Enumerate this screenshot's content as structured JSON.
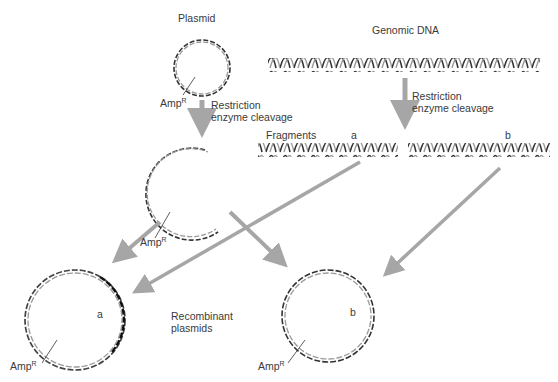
{
  "labels": {
    "plasmid": "Plasmid",
    "genomic_dna": "Genomic DNA",
    "restriction_1": "Restriction",
    "restriction_2": "enzyme cleavage",
    "fragments": "Fragments",
    "frag_a": "a",
    "frag_b": "b",
    "amp": "Amp",
    "amp_sup": "R",
    "recombinant_1": "Recombinant",
    "recombinant_2": "plasmids"
  },
  "colors": {
    "arrow": "#a6a6a6",
    "strand_dark": "#3a3a3a",
    "strand_light": "#8a8a8a",
    "text": "#3a3a3a"
  }
}
